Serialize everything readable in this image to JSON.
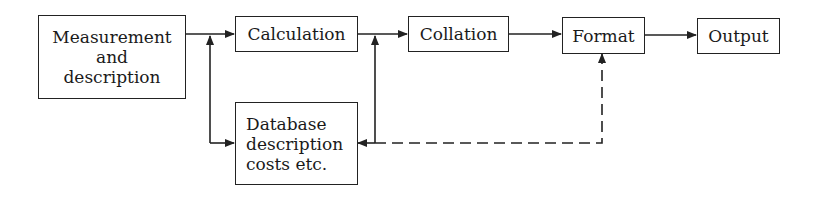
{
  "diagram": {
    "nodes": {
      "measurement": {
        "lines": [
          "Measurement",
          "and",
          "description"
        ]
      },
      "calculation": {
        "label": "Calculation"
      },
      "collation": {
        "label": "Collation"
      },
      "format": {
        "label": "Format"
      },
      "output": {
        "label": "Output"
      },
      "database": {
        "lines": [
          "Database",
          "description",
          "costs etc."
        ]
      }
    },
    "edges": [
      {
        "from": "measurement",
        "to": "calculation",
        "style": "solid"
      },
      {
        "from": "database",
        "to": "calculation",
        "style": "solid"
      },
      {
        "from": "measurement",
        "to": "database",
        "style": "solid"
      },
      {
        "from": "calculation",
        "to": "collation",
        "style": "solid"
      },
      {
        "from": "database",
        "to": "collation",
        "style": "solid"
      },
      {
        "from": "calculation",
        "to": "database",
        "style": "solid"
      },
      {
        "from": "collation",
        "to": "format",
        "style": "solid"
      },
      {
        "from": "database",
        "to": "format",
        "style": "dashed"
      },
      {
        "from": "format",
        "to": "output",
        "style": "solid"
      }
    ],
    "colors": {
      "line": "#222222",
      "background": "#ffffff"
    }
  }
}
